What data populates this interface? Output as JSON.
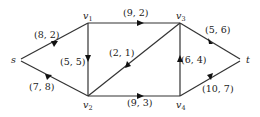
{
  "diagram": {
    "type": "flow-network",
    "nodes": [
      {
        "id": "s",
        "label": "s",
        "sub": "",
        "x": 19,
        "y": 60
      },
      {
        "id": "v1",
        "label": "v",
        "sub": "1",
        "x": 88,
        "y": 23
      },
      {
        "id": "v2",
        "label": "v",
        "sub": "2",
        "x": 88,
        "y": 96
      },
      {
        "id": "v3",
        "label": "v",
        "sub": "3",
        "x": 180,
        "y": 23
      },
      {
        "id": "v4",
        "label": "v",
        "sub": "4",
        "x": 180,
        "y": 96
      },
      {
        "id": "t",
        "label": "t",
        "sub": "",
        "x": 242,
        "y": 60
      }
    ],
    "edges": [
      {
        "from": "s",
        "to": "v1",
        "label": "(8, 2)"
      },
      {
        "from": "s",
        "to": "v2",
        "label": "(7, 8)"
      },
      {
        "from": "v1",
        "to": "v2",
        "label": "(5, 5)"
      },
      {
        "from": "v1",
        "to": "v3",
        "label": "(9, 2)"
      },
      {
        "from": "v3",
        "to": "v2",
        "label": "(2, 1)"
      },
      {
        "from": "v2",
        "to": "v4",
        "label": "(9, 3)"
      },
      {
        "from": "v4",
        "to": "v3",
        "label": "(6, 4)"
      },
      {
        "from": "v3",
        "to": "t",
        "label": "(5, 6)"
      },
      {
        "from": "v4",
        "to": "t",
        "label": "(10, 7)"
      }
    ]
  }
}
